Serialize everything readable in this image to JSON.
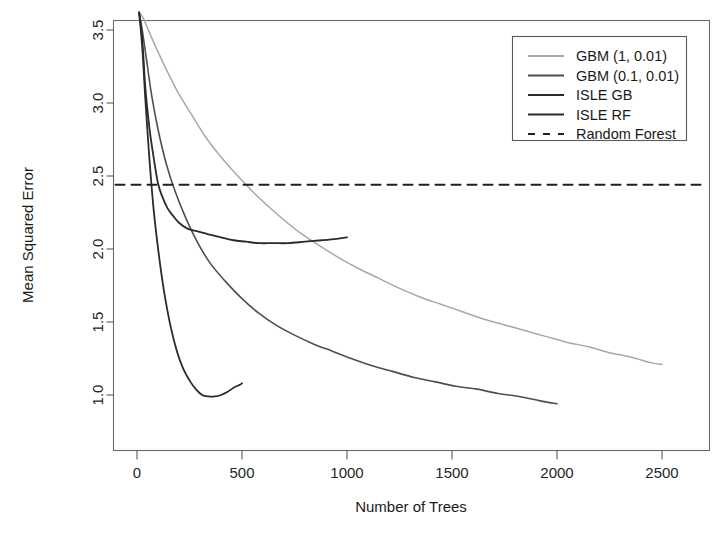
{
  "chart_data": {
    "type": "line",
    "title": "",
    "xlabel": "Number of Trees",
    "ylabel": "Mean Squared Error",
    "xlim": [
      -60,
      2620
    ],
    "ylim": [
      0.62,
      3.72
    ],
    "xticks": [
      0,
      500,
      1000,
      1500,
      2000,
      2500
    ],
    "xtick_labels": [
      "0",
      "500",
      "1000",
      "1500",
      "2000",
      "2500"
    ],
    "yticks": [
      1.0,
      1.5,
      2.0,
      2.5,
      3.0,
      3.5
    ],
    "ytick_labels": [
      "1.0",
      "1.5",
      "2.0",
      "2.5",
      "3.0",
      "3.5"
    ],
    "grid": false,
    "legend_position": "top-right",
    "series": [
      {
        "name": "GBM (1, 0.01)",
        "color": "#a8a8a8",
        "width": 1.5,
        "dash": "none",
        "x": [
          10,
          30,
          60,
          100,
          150,
          200,
          260,
          330,
          400,
          480,
          560,
          650,
          750,
          850,
          950,
          1050,
          1150,
          1250,
          1350,
          1450,
          1550,
          1650,
          1750,
          1850,
          1950,
          2050,
          2150,
          2250,
          2350,
          2450,
          2500
        ],
        "y": [
          3.62,
          3.58,
          3.48,
          3.35,
          3.2,
          3.06,
          2.92,
          2.76,
          2.63,
          2.5,
          2.38,
          2.26,
          2.14,
          2.04,
          1.95,
          1.87,
          1.8,
          1.73,
          1.67,
          1.62,
          1.57,
          1.52,
          1.48,
          1.44,
          1.4,
          1.36,
          1.33,
          1.29,
          1.26,
          1.22,
          1.21
        ]
      },
      {
        "name": "GBM (0.1, 0.01)",
        "color": "#4f4f4f",
        "width": 1.6,
        "dash": "none",
        "x": [
          10,
          25,
          45,
          70,
          100,
          140,
          180,
          230,
          290,
          350,
          420,
          500,
          580,
          660,
          750,
          840,
          930,
          1020,
          1120,
          1220,
          1320,
          1420,
          1520,
          1620,
          1720,
          1820,
          1920,
          2000
        ],
        "y": [
          3.62,
          3.5,
          3.3,
          3.05,
          2.82,
          2.58,
          2.4,
          2.22,
          2.04,
          1.9,
          1.78,
          1.66,
          1.56,
          1.48,
          1.41,
          1.35,
          1.3,
          1.25,
          1.2,
          1.16,
          1.12,
          1.09,
          1.06,
          1.04,
          1.01,
          0.99,
          0.96,
          0.94
        ]
      },
      {
        "name": "ISLE  GB",
        "color": "#2b2b2b",
        "width": 1.8,
        "dash": "none",
        "x": [
          10,
          25,
          40,
          60,
          80,
          100,
          120,
          145,
          170,
          200,
          240,
          290,
          340,
          400,
          460,
          520,
          580,
          650,
          720,
          800,
          880,
          950,
          1000
        ],
        "y": [
          3.62,
          3.44,
          3.1,
          2.82,
          2.62,
          2.45,
          2.36,
          2.28,
          2.23,
          2.18,
          2.14,
          2.12,
          2.1,
          2.08,
          2.06,
          2.05,
          2.04,
          2.04,
          2.04,
          2.05,
          2.06,
          2.07,
          2.08
        ]
      },
      {
        "name": "ISLE RF",
        "color": "#2b2b2b",
        "width": 1.8,
        "dash": "none",
        "x": [
          10,
          25,
          40,
          60,
          80,
          105,
          130,
          160,
          190,
          220,
          250,
          280,
          310,
          340,
          370,
          400,
          430,
          460,
          490,
          500
        ],
        "y": [
          3.62,
          3.38,
          3.02,
          2.6,
          2.26,
          1.95,
          1.7,
          1.47,
          1.3,
          1.18,
          1.1,
          1.04,
          1.0,
          0.99,
          0.99,
          1.0,
          1.02,
          1.05,
          1.07,
          1.08
        ]
      },
      {
        "name": "Random Forest",
        "color": "#1f1f1f",
        "width": 2.0,
        "dash": "dashed",
        "horizontal_value": 2.44
      }
    ],
    "annotations": []
  },
  "legend": {
    "entries": [
      {
        "label": "GBM (1, 0.01)"
      },
      {
        "label": "GBM (0.1, 0.01)"
      },
      {
        "label": "ISLE  GB"
      },
      {
        "label": "ISLE RF"
      },
      {
        "label": "Random Forest"
      }
    ]
  },
  "axes": {
    "x_title": "Number of Trees",
    "y_title": "Mean Squared Error"
  }
}
